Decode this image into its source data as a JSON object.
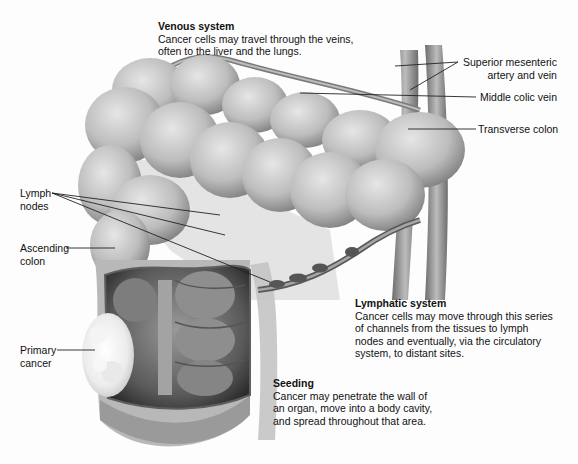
{
  "figure": {
    "callouts": [
      {
        "id": "venous",
        "title": "Venous system",
        "lines": [
          "Cancer cells may travel through the veins,",
          "often to the liver and the lungs."
        ]
      },
      {
        "id": "lymphatic",
        "title": "Lymphatic system",
        "lines": [
          "Cancer cells may move through this series",
          "of channels from the tissues to lymph",
          "nodes and eventually, via the circulatory",
          "system, to distant sites."
        ]
      },
      {
        "id": "seeding",
        "title": "Seeding",
        "lines": [
          "Cancer may penetrate the wall of",
          "an organ, move into a body cavity,",
          "and spread throughout that area."
        ]
      }
    ],
    "labels": {
      "superior_mesenteric": [
        "Superior mesenteric",
        "artery and vein"
      ],
      "middle_colic": "Middle colic vein",
      "transverse_colon": "Transverse colon",
      "lymph_nodes": [
        "Lymph",
        "nodes"
      ],
      "ascending_colon": [
        "Ascending",
        "colon"
      ],
      "primary_cancer": [
        "Primary",
        "cancer"
      ]
    },
    "colors": {
      "background": "#fdfdfd",
      "tissue_light": "#d6d6d6",
      "tissue_mid": "#a9a9a9",
      "tissue_dark": "#3a3a3a",
      "leader_line": "#222222",
      "tumor": "#efefef"
    }
  }
}
